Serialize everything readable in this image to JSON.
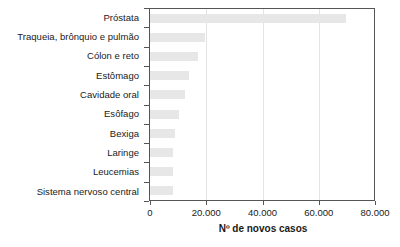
{
  "chart_data": {
    "type": "bar",
    "orientation": "horizontal",
    "title": "",
    "xlabel": "Nº de novos casos",
    "ylabel": "",
    "xlim": [
      0,
      80000
    ],
    "ylim": null,
    "grid": true,
    "legend": null,
    "xticks": [
      0,
      20000,
      40000,
      60000,
      80000
    ],
    "xticklabels": [
      "0",
      "20.000",
      "40.000",
      "60.000",
      "80.000"
    ],
    "bar_color": "#e7e7e7",
    "categories": [
      "Próstata",
      "Traqueia, brônquio e pulmão",
      "Cólon e reto",
      "Estômago",
      "Cavidade oral",
      "Esôfago",
      "Bexiga",
      "Laringe",
      "Leucemias",
      "Sistema nervoso central"
    ],
    "values": [
      69700,
      19700,
      17000,
      14000,
      12400,
      10400,
      8800,
      8200,
      8000,
      8000
    ]
  }
}
